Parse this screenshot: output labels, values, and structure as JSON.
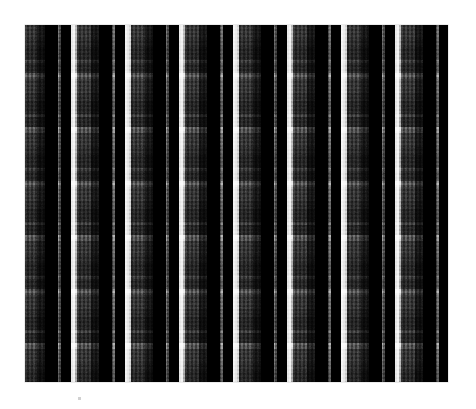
{
  "image": {
    "kind": "fabric-swatch-photo",
    "subject": "plaid tartan fabric",
    "width": 476,
    "height": 409,
    "background_color": "#ffffff",
    "alt_text": "Black, grey and white plaid tartan fabric swatch on a white background"
  },
  "swatch": {
    "x": 25,
    "y": 25,
    "width": 423,
    "height": 357,
    "base_color": "#0a0a0a",
    "edge_color": "#8c8c8c"
  },
  "palette": {
    "black": "#070707",
    "near_black": "#131313",
    "dark_charcoal": "#1d1d1d",
    "charcoal": "#2b2b2b",
    "mid_grey": "#4a4a4a",
    "grey": "#5e5e5e",
    "light_grey": "#8f8f8f",
    "pale_grey": "#b4b4b4",
    "white": "#e8e8e8"
  },
  "sett": {
    "repeat_px": 54,
    "warp_offset_px": 8,
    "weft_offset_px": 6,
    "bands": [
      {
        "name": "white-guard",
        "start": 0,
        "width": 4,
        "color": "#e8e8e8"
      },
      {
        "name": "pale-edge",
        "start": 4,
        "width": 2,
        "color": "#b4b4b4"
      },
      {
        "name": "mid-ground",
        "start": 6,
        "width": 14,
        "color": "#4a4a4a"
      },
      {
        "name": "charcoal",
        "start": 20,
        "width": 8,
        "color": "#2b2b2b"
      },
      {
        "name": "black-block",
        "start": 28,
        "width": 13,
        "color": "#070707"
      },
      {
        "name": "grey-pinstripe",
        "start": 41,
        "width": 3,
        "color": "#6d6d6d"
      },
      {
        "name": "black-block-2",
        "start": 44,
        "width": 10,
        "color": "#0d0d0d"
      }
    ]
  },
  "weave": {
    "type": "twill",
    "thread_px": 2,
    "texture_opacity": 0.55,
    "grain_opacity": 0.75
  },
  "artifacts": {
    "speck": {
      "x": 78,
      "y": 397,
      "size": 3,
      "color": "#c9c9c9"
    }
  }
}
